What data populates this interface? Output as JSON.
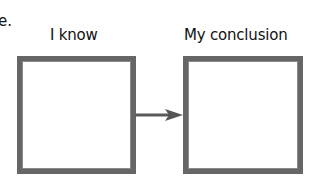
{
  "diagram": {
    "fragment_text": "e.",
    "nodes": [
      {
        "id": "left",
        "label": "I know"
      },
      {
        "id": "right",
        "label": "My conclusion"
      }
    ],
    "edges": [
      {
        "from": "left",
        "to": "right",
        "type": "arrow"
      }
    ],
    "colors": {
      "box_border": "#666666",
      "arrow": "#555555",
      "text": "#111111"
    }
  }
}
